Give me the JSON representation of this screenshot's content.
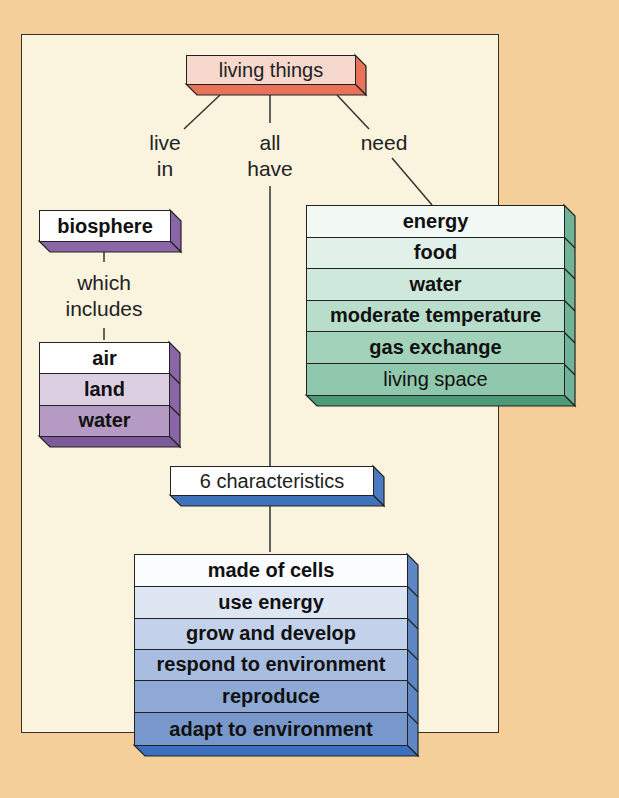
{
  "diagram": {
    "title_node": {
      "label": "living things",
      "color": "#e9735a",
      "face": "#f6d8cc"
    },
    "connectors": {
      "live_in": "live\nin",
      "all_have": "all\nhave",
      "need": "need",
      "which_includes": "which\nincludes"
    },
    "biosphere": {
      "label": "biosphere",
      "color": "#8a66a6",
      "items": [
        {
          "label": "air",
          "fill": "#ffffff"
        },
        {
          "label": "land",
          "fill": "#dccfe2"
        },
        {
          "label": "water",
          "fill": "#b59ac4"
        }
      ]
    },
    "needs": {
      "color": "#5ea98a",
      "items": [
        {
          "label": "energy",
          "fill": "#f3faf6",
          "bold": true
        },
        {
          "label": "food",
          "fill": "#e1f1e9",
          "bold": true
        },
        {
          "label": "water",
          "fill": "#cfe8dc",
          "bold": true
        },
        {
          "label": "moderate temperature",
          "fill": "#b9ddcb",
          "bold": true
        },
        {
          "label": "gas exchange",
          "fill": "#a2d2ba",
          "bold": true
        },
        {
          "label": "living space",
          "fill": "#8fc8ac",
          "bold": false
        }
      ]
    },
    "characteristics": {
      "label": "6 characteristics",
      "color": "#4a7bc0",
      "items": [
        {
          "label": "made of cells",
          "fill": "#fbfcfe"
        },
        {
          "label": "use energy",
          "fill": "#dfe6f3"
        },
        {
          "label": "grow and develop",
          "fill": "#c4d1ea"
        },
        {
          "label": "respond to environment",
          "fill": "#a9bde0"
        },
        {
          "label": "reproduce",
          "fill": "#8ea9d6"
        },
        {
          "label": "adapt to environment",
          "fill": "#7898cc"
        }
      ]
    }
  }
}
